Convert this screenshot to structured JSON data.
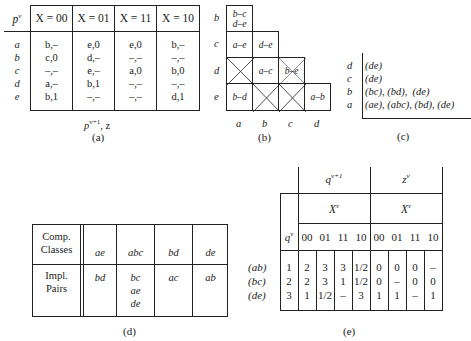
{
  "table_a": {
    "state_header": "p",
    "state_header_sup": "v",
    "column_headers": [
      "X = 00",
      "X = 01",
      "X = 11",
      "X = 10"
    ],
    "rows": [
      {
        "state": "a",
        "cells": [
          "b,–",
          "e,0",
          "e,0",
          "b,–"
        ]
      },
      {
        "state": "b",
        "cells": [
          "c,0",
          "d,–",
          "–,–",
          "–,–"
        ]
      },
      {
        "state": "c",
        "cells": [
          "–,–",
          "e,–",
          "a,0",
          "b,0"
        ]
      },
      {
        "state": "d",
        "cells": [
          "a,–",
          "b,1",
          "–,–",
          "–,–"
        ]
      },
      {
        "state": "e",
        "cells": [
          "b,1",
          "–,–",
          "–,–",
          "d,1"
        ]
      }
    ],
    "footer": "p",
    "footer_sup": "v+1",
    "footer_rest": ", z",
    "caption": "(a)"
  },
  "table_b": {
    "row_labels": [
      "b",
      "c",
      "d",
      "e"
    ],
    "col_labels": [
      "a",
      "b",
      "c",
      "d"
    ],
    "cells": [
      [
        "b–c d–e"
      ],
      [
        "a–e",
        "d–e"
      ],
      [
        "X",
        "a–c",
        "b–e"
      ],
      [
        "b–d",
        "X",
        "X",
        "a–b"
      ]
    ],
    "caption": "(b)"
  },
  "table_c": {
    "rows": [
      {
        "label": "d",
        "classes": "(de)"
      },
      {
        "label": "c",
        "classes": "(de)"
      },
      {
        "label": "b",
        "classes": "(bc), (bd),  (de)"
      },
      {
        "label": "a",
        "classes": "(ae), (abc), (bd), (de)"
      }
    ],
    "caption": "(c)"
  },
  "table_d": {
    "row_headers": [
      "Comp.\nClasses",
      "Impl.\nPairs"
    ],
    "comp_classes": [
      "ae",
      "abc",
      "bd",
      "de"
    ],
    "impl_pairs": [
      [
        "bd"
      ],
      [
        "bc",
        "ae",
        "de"
      ],
      [
        "ac"
      ],
      [
        "ab"
      ]
    ],
    "caption": "(d)"
  },
  "table_e": {
    "next_state_header": "q",
    "next_state_sup": "v+1",
    "output_header": "z",
    "output_sup": "v",
    "input_header": "X",
    "input_sup": "v",
    "state_header": "q",
    "state_sup": "v",
    "input_codes": [
      "00",
      "01",
      "11",
      "10",
      "00",
      "01",
      "11",
      "10"
    ],
    "rows": [
      {
        "label": "(ab)",
        "state": "1",
        "next": [
          "2",
          "3",
          "3",
          "1/2"
        ],
        "out": [
          "0",
          "0",
          "0",
          "–"
        ]
      },
      {
        "label": "(bc)",
        "state": "2",
        "next": [
          "2",
          "3",
          "1",
          "1/2"
        ],
        "out": [
          "0",
          "–",
          "0",
          "0"
        ]
      },
      {
        "label": "(de)",
        "state": "3",
        "next": [
          "1",
          "1/2",
          "–",
          "3"
        ],
        "out": [
          "1",
          "1",
          "–",
          "1"
        ]
      }
    ],
    "caption": "(e)"
  }
}
